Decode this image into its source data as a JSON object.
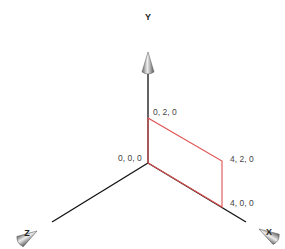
{
  "diagram": {
    "axes": {
      "x": {
        "label": "X"
      },
      "y": {
        "label": "Y"
      },
      "z": {
        "label": "Z"
      }
    },
    "points": {
      "origin": "0, 0, 0",
      "p_0_2_0": "0, 2, 0",
      "p_4_2_0": "4, 2, 0",
      "p_4_0_0": "4, 0, 0"
    },
    "colors": {
      "axis": "#111111",
      "rectangle": "#e05050",
      "arrowhead": "#9a9a9a"
    }
  }
}
